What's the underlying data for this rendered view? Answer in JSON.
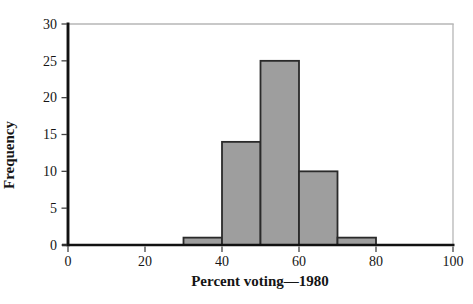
{
  "chart_data": {
    "type": "bar",
    "subtype": "histogram",
    "title": "",
    "xlabel": "Percent voting—1980",
    "ylabel": "Frequency",
    "bin_edges": [
      30,
      40,
      50,
      60,
      70,
      80
    ],
    "categories": [
      "30–40",
      "40–50",
      "50–60",
      "60–70",
      "70–80"
    ],
    "values": [
      1,
      14,
      25,
      10,
      1
    ],
    "xlim": [
      0,
      100
    ],
    "ylim": [
      0,
      30
    ],
    "x_ticks": [
      0,
      20,
      40,
      60,
      80,
      100
    ],
    "y_ticks": [
      0,
      5,
      10,
      15,
      20,
      25,
      30
    ],
    "grid": false,
    "legend": "none",
    "colors": {
      "bar_fill": "#9e9e9e",
      "bar_border": "#2a2a2a",
      "axis": "#111111",
      "frame": "#b6b6b6",
      "tick": "#444444",
      "text": "#151515",
      "background": "#ffffff"
    }
  }
}
